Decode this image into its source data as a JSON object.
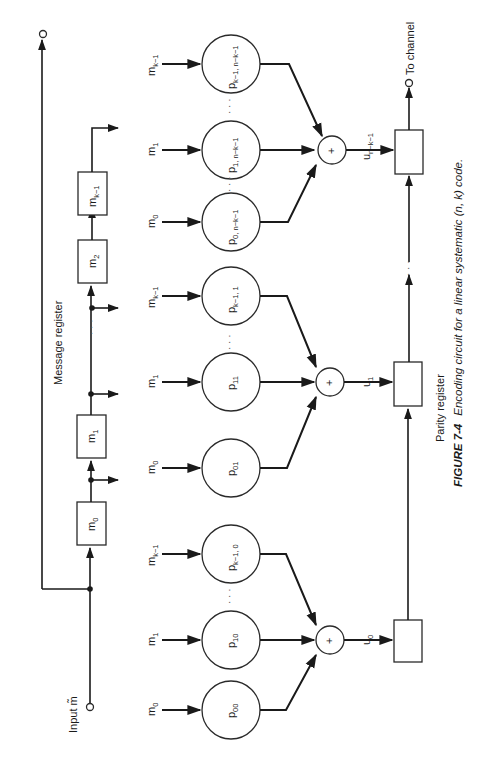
{
  "figure": {
    "number": "FIGURE 7-4",
    "caption": "Encoding circuit for a linear systematic (n, k) code.",
    "orientation": "rotated 90° counter-clockwise"
  },
  "labels": {
    "input": "Input m̃",
    "message_register": "Message register",
    "parity_register": "Parity register",
    "to_channel": "To channel",
    "ellipsis": "· · ·"
  },
  "message_register": {
    "cells": [
      {
        "base": "m",
        "sub": "0"
      },
      {
        "base": "m",
        "sub": "1"
      },
      {
        "base": "m",
        "sub": "2"
      },
      {
        "base": "m",
        "sub": "k−1"
      }
    ]
  },
  "parity_groups": [
    {
      "output": {
        "base": "u",
        "sub": "0"
      },
      "coefficients": [
        {
          "input": {
            "base": "m",
            "sub": "0"
          },
          "label": {
            "base": "p",
            "sub": "00"
          }
        },
        {
          "input": {
            "base": "m",
            "sub": "1"
          },
          "label": {
            "base": "p",
            "sub": "10"
          }
        },
        {
          "input": {
            "base": "m",
            "sub": "k−1"
          },
          "label": {
            "base": "p",
            "sub": "k−1, 0"
          }
        }
      ]
    },
    {
      "output": {
        "base": "u",
        "sub": "1"
      },
      "coefficients": [
        {
          "input": {
            "base": "m",
            "sub": "0"
          },
          "label": {
            "base": "p",
            "sub": "01"
          }
        },
        {
          "input": {
            "base": "m",
            "sub": "1"
          },
          "label": {
            "base": "p",
            "sub": "11"
          }
        },
        {
          "input": {
            "base": "m",
            "sub": "k−1"
          },
          "label": {
            "base": "p",
            "sub": "k−1, 1"
          }
        }
      ]
    },
    {
      "output": {
        "base": "u",
        "sub": "n−k−1"
      },
      "coefficients": [
        {
          "input": {
            "base": "m",
            "sub": "0"
          },
          "label": {
            "base": "p",
            "sub": "0, n−k−1"
          }
        },
        {
          "input": {
            "base": "m",
            "sub": "1"
          },
          "label": {
            "base": "p",
            "sub": "1, n−k−1"
          }
        },
        {
          "input": {
            "base": "m",
            "sub": "k−1"
          },
          "label": {
            "base": "p",
            "sub": "k−1, n−k−1"
          }
        }
      ]
    }
  ],
  "adder_symbol": "+",
  "colors": {
    "ink": "#1a1a1a",
    "background": "#ffffff"
  }
}
